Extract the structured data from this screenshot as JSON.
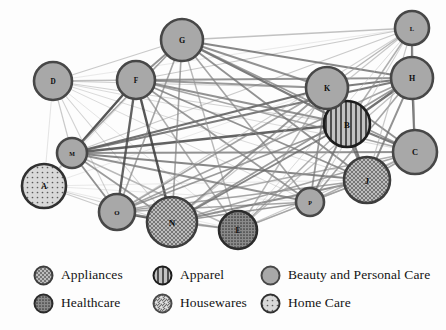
{
  "figure": {
    "title": "",
    "background_color": "#fdfdfd",
    "width": 446,
    "height": 330
  },
  "chart_data": {
    "type": "network",
    "title": "",
    "xlabel": "",
    "ylabel": "",
    "layout": "force-directed",
    "grid": false,
    "legend_position": "bottom",
    "node_label_key": "id",
    "categories": [
      {
        "key": "appliances",
        "label": "Appliances",
        "pattern": "crosshatch",
        "fill": "#b6b6b6",
        "stroke": "#3d3d3d"
      },
      {
        "key": "apparel",
        "label": "Apparel",
        "pattern": "vertical-stripes",
        "fill": "#b0b0b0",
        "stroke": "#1d1d1d"
      },
      {
        "key": "beauty_personal_care",
        "label": "Beauty and Personal Care",
        "pattern": "solid",
        "fill": "#a8a8a8",
        "stroke": "#474747"
      },
      {
        "key": "healthcare",
        "label": "Healthcare",
        "pattern": "dense-dots",
        "fill": "#8f8f8f",
        "stroke": "#2b2b2b"
      },
      {
        "key": "housewares",
        "label": "Housewares",
        "pattern": "diagonal-stripes",
        "fill": "#d8d8d8",
        "stroke": "#4a4a4a"
      },
      {
        "key": "home_care",
        "label": "Home Care",
        "pattern": "sparse-dots",
        "fill": "#d2d2d2",
        "stroke": "#313131"
      }
    ],
    "nodes": [
      {
        "id": "A",
        "label": "A",
        "x": 44,
        "y": 186,
        "r": 22,
        "category": "home_care"
      },
      {
        "id": "B",
        "label": "B",
        "x": 347,
        "y": 124,
        "r": 23,
        "category": "apparel"
      },
      {
        "id": "C",
        "label": "C",
        "x": 415,
        "y": 152,
        "r": 22,
        "category": "beauty_personal_care"
      },
      {
        "id": "D",
        "label": "D",
        "x": 53,
        "y": 81,
        "r": 19,
        "category": "beauty_personal_care"
      },
      {
        "id": "E",
        "label": "E",
        "x": 238,
        "y": 230,
        "r": 19,
        "category": "healthcare"
      },
      {
        "id": "F",
        "label": "F",
        "x": 136,
        "y": 80,
        "r": 19,
        "category": "beauty_personal_care"
      },
      {
        "id": "G",
        "label": "G",
        "x": 182,
        "y": 40,
        "r": 21,
        "category": "beauty_personal_care"
      },
      {
        "id": "H",
        "label": "H",
        "x": 412,
        "y": 78,
        "r": 21,
        "category": "beauty_personal_care"
      },
      {
        "id": "J",
        "label": "J",
        "x": 367,
        "y": 180,
        "r": 23,
        "category": "appliances"
      },
      {
        "id": "K",
        "label": "K",
        "x": 327,
        "y": 88,
        "r": 21,
        "category": "beauty_personal_care"
      },
      {
        "id": "L",
        "label": "L",
        "x": 412,
        "y": 28,
        "r": 17,
        "category": "beauty_personal_care"
      },
      {
        "id": "M",
        "label": "M",
        "x": 72,
        "y": 153,
        "r": 15,
        "category": "beauty_personal_care"
      },
      {
        "id": "N",
        "label": "N",
        "x": 172,
        "y": 222,
        "r": 25,
        "category": "appliances"
      },
      {
        "id": "O",
        "label": "O",
        "x": 117,
        "y": 212,
        "r": 18,
        "category": "beauty_personal_care"
      },
      {
        "id": "P",
        "label": "P",
        "x": 310,
        "y": 202,
        "r": 14,
        "category": "beauty_personal_care"
      }
    ],
    "edges": [
      {
        "source": "A",
        "target": "D",
        "weight": 0.15
      },
      {
        "source": "A",
        "target": "M",
        "weight": 0.35
      },
      {
        "source": "A",
        "target": "O",
        "weight": 0.3
      },
      {
        "source": "A",
        "target": "N",
        "weight": 0.25
      },
      {
        "source": "A",
        "target": "F",
        "weight": 0.15
      },
      {
        "source": "A",
        "target": "G",
        "weight": 0.12
      },
      {
        "source": "A",
        "target": "K",
        "weight": 0.12
      },
      {
        "source": "A",
        "target": "J",
        "weight": 0.12
      },
      {
        "source": "A",
        "target": "P",
        "weight": 0.12
      },
      {
        "source": "A",
        "target": "E",
        "weight": 0.12
      },
      {
        "source": "D",
        "target": "M",
        "weight": 0.3
      },
      {
        "source": "D",
        "target": "F",
        "weight": 0.35
      },
      {
        "source": "D",
        "target": "G",
        "weight": 0.3
      },
      {
        "source": "D",
        "target": "O",
        "weight": 0.25
      },
      {
        "source": "D",
        "target": "N",
        "weight": 0.25
      },
      {
        "source": "D",
        "target": "K",
        "weight": 0.25
      },
      {
        "source": "D",
        "target": "B",
        "weight": 0.25
      },
      {
        "source": "D",
        "target": "H",
        "weight": 0.2
      },
      {
        "source": "D",
        "target": "C",
        "weight": 0.2
      },
      {
        "source": "D",
        "target": "J",
        "weight": 0.2
      },
      {
        "source": "D",
        "target": "P",
        "weight": 0.2
      },
      {
        "source": "D",
        "target": "E",
        "weight": 0.15
      },
      {
        "source": "D",
        "target": "L",
        "weight": 0.12
      },
      {
        "source": "M",
        "target": "F",
        "weight": 0.85
      },
      {
        "source": "M",
        "target": "G",
        "weight": 0.5
      },
      {
        "source": "M",
        "target": "O",
        "weight": 0.6
      },
      {
        "source": "M",
        "target": "N",
        "weight": 0.55
      },
      {
        "source": "M",
        "target": "K",
        "weight": 0.75
      },
      {
        "source": "M",
        "target": "B",
        "weight": 0.8
      },
      {
        "source": "M",
        "target": "H",
        "weight": 0.7
      },
      {
        "source": "M",
        "target": "C",
        "weight": 0.6
      },
      {
        "source": "M",
        "target": "J",
        "weight": 0.65
      },
      {
        "source": "M",
        "target": "P",
        "weight": 0.6
      },
      {
        "source": "M",
        "target": "E",
        "weight": 0.4
      },
      {
        "source": "M",
        "target": "L",
        "weight": 0.3
      },
      {
        "source": "F",
        "target": "G",
        "weight": 0.6
      },
      {
        "source": "F",
        "target": "O",
        "weight": 0.8
      },
      {
        "source": "F",
        "target": "N",
        "weight": 0.85
      },
      {
        "source": "F",
        "target": "K",
        "weight": 0.55
      },
      {
        "source": "F",
        "target": "B",
        "weight": 0.6
      },
      {
        "source": "F",
        "target": "H",
        "weight": 0.55
      },
      {
        "source": "F",
        "target": "C",
        "weight": 0.5
      },
      {
        "source": "F",
        "target": "J",
        "weight": 0.6
      },
      {
        "source": "F",
        "target": "P",
        "weight": 0.55
      },
      {
        "source": "F",
        "target": "E",
        "weight": 0.45
      },
      {
        "source": "F",
        "target": "L",
        "weight": 0.3
      },
      {
        "source": "G",
        "target": "O",
        "weight": 0.5
      },
      {
        "source": "G",
        "target": "N",
        "weight": 0.5
      },
      {
        "source": "G",
        "target": "K",
        "weight": 0.6
      },
      {
        "source": "G",
        "target": "B",
        "weight": 0.7
      },
      {
        "source": "G",
        "target": "H",
        "weight": 0.65
      },
      {
        "source": "G",
        "target": "C",
        "weight": 0.55
      },
      {
        "source": "G",
        "target": "J",
        "weight": 0.6
      },
      {
        "source": "G",
        "target": "P",
        "weight": 0.5
      },
      {
        "source": "G",
        "target": "E",
        "weight": 0.4
      },
      {
        "source": "G",
        "target": "L",
        "weight": 0.35
      },
      {
        "source": "O",
        "target": "N",
        "weight": 0.8
      },
      {
        "source": "O",
        "target": "K",
        "weight": 0.5
      },
      {
        "source": "O",
        "target": "B",
        "weight": 0.55
      },
      {
        "source": "O",
        "target": "H",
        "weight": 0.5
      },
      {
        "source": "O",
        "target": "C",
        "weight": 0.45
      },
      {
        "source": "O",
        "target": "J",
        "weight": 0.5
      },
      {
        "source": "O",
        "target": "P",
        "weight": 0.5
      },
      {
        "source": "O",
        "target": "E",
        "weight": 0.45
      },
      {
        "source": "O",
        "target": "L",
        "weight": 0.25
      },
      {
        "source": "N",
        "target": "K",
        "weight": 0.55
      },
      {
        "source": "N",
        "target": "B",
        "weight": 0.65
      },
      {
        "source": "N",
        "target": "H",
        "weight": 0.55
      },
      {
        "source": "N",
        "target": "C",
        "weight": 0.5
      },
      {
        "source": "N",
        "target": "J",
        "weight": 0.6
      },
      {
        "source": "N",
        "target": "P",
        "weight": 0.55
      },
      {
        "source": "N",
        "target": "E",
        "weight": 0.5
      },
      {
        "source": "N",
        "target": "L",
        "weight": 0.3
      },
      {
        "source": "K",
        "target": "B",
        "weight": 0.75
      },
      {
        "source": "K",
        "target": "H",
        "weight": 0.7
      },
      {
        "source": "K",
        "target": "C",
        "weight": 0.6
      },
      {
        "source": "K",
        "target": "J",
        "weight": 0.65
      },
      {
        "source": "K",
        "target": "P",
        "weight": 0.55
      },
      {
        "source": "K",
        "target": "E",
        "weight": 0.4
      },
      {
        "source": "K",
        "target": "L",
        "weight": 0.4
      },
      {
        "source": "B",
        "target": "H",
        "weight": 0.75
      },
      {
        "source": "B",
        "target": "C",
        "weight": 0.7
      },
      {
        "source": "B",
        "target": "J",
        "weight": 0.7
      },
      {
        "source": "B",
        "target": "P",
        "weight": 0.6
      },
      {
        "source": "B",
        "target": "E",
        "weight": 0.45
      },
      {
        "source": "B",
        "target": "L",
        "weight": 0.45
      },
      {
        "source": "H",
        "target": "C",
        "weight": 0.75
      },
      {
        "source": "H",
        "target": "J",
        "weight": 0.6
      },
      {
        "source": "H",
        "target": "P",
        "weight": 0.5
      },
      {
        "source": "H",
        "target": "E",
        "weight": 0.35
      },
      {
        "source": "H",
        "target": "L",
        "weight": 0.7
      },
      {
        "source": "C",
        "target": "J",
        "weight": 0.5
      },
      {
        "source": "C",
        "target": "P",
        "weight": 0.45
      },
      {
        "source": "C",
        "target": "E",
        "weight": 0.3
      },
      {
        "source": "C",
        "target": "L",
        "weight": 0.4
      },
      {
        "source": "J",
        "target": "P",
        "weight": 0.5
      },
      {
        "source": "J",
        "target": "E",
        "weight": 0.35
      },
      {
        "source": "J",
        "target": "L",
        "weight": 0.3
      },
      {
        "source": "P",
        "target": "E",
        "weight": 0.4
      },
      {
        "source": "P",
        "target": "L",
        "weight": 0.25
      },
      {
        "source": "E",
        "target": "L",
        "weight": 0.2
      }
    ]
  },
  "legend": {
    "rows": [
      [
        {
          "key": "appliances",
          "label": "Appliances",
          "x": 33
        },
        {
          "key": "apparel",
          "label": "Apparel",
          "x": 152
        },
        {
          "key": "beauty_personal_care",
          "label": "Beauty and Personal Care",
          "x": 260
        }
      ],
      [
        {
          "key": "healthcare",
          "label": "Healthcare",
          "x": 33
        },
        {
          "key": "housewares",
          "label": "Housewares",
          "x": 152
        },
        {
          "key": "home_care",
          "label": "Home Care",
          "x": 260
        }
      ]
    ]
  }
}
